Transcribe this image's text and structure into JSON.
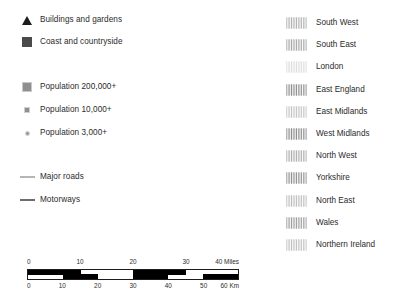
{
  "legend": {
    "land_classes": [
      {
        "label": "Buildings and gardens",
        "symbol": "filled-triangle",
        "color": "#1c1c1c"
      },
      {
        "label": "Coast and countryside",
        "symbol": "filled-square",
        "color": "#4a4a4a"
      }
    ],
    "population_classes": [
      {
        "label": "Population 200,000+",
        "symbol": "large-square",
        "color": "#8f8f8f"
      },
      {
        "label": "Population 10,000+",
        "symbol": "small-square",
        "color": "#8f8f8f"
      },
      {
        "label": "Population 3,000+",
        "symbol": "small-dot",
        "color": "#9a9a9a"
      }
    ],
    "road_classes": [
      {
        "label": "Major roads",
        "symbol": "thin-line",
        "color": "#b5b5b5"
      },
      {
        "label": "Motorways",
        "symbol": "thick-line",
        "color": "#6d6d6d"
      }
    ]
  },
  "regions": {
    "items": [
      {
        "label": "South West",
        "color": "#b0b0b0"
      },
      {
        "label": "South East",
        "color": "#a6a6a6"
      },
      {
        "label": "London",
        "color": "#dcdcdc"
      },
      {
        "label": "East England",
        "color": "#8c8c8c"
      },
      {
        "label": "East Midlands",
        "color": "#c4c4c4"
      },
      {
        "label": "West Midlands",
        "color": "#8a8a8a"
      },
      {
        "label": "North West",
        "color": "#adadad"
      },
      {
        "label": "Yorkshire",
        "color": "#909090"
      },
      {
        "label": "North East",
        "color": "#bdbdbd"
      },
      {
        "label": "Wales",
        "color": "#9c9c9c"
      },
      {
        "label": "Northern Ireland",
        "color": "#c0c0c0"
      }
    ]
  },
  "scalebar": {
    "miles": {
      "unit_label": "40 Miles",
      "ticks": [
        "0",
        "10",
        "20",
        "30"
      ],
      "max": 40
    },
    "kilometres": {
      "unit_label": "60 Km",
      "ticks": [
        "0",
        "10",
        "20",
        "30",
        "40",
        "50"
      ],
      "max": 60
    }
  }
}
